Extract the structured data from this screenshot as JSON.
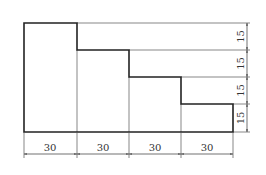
{
  "drawing": {
    "title": "Stepped block dimension drawing",
    "colors": {
      "outline": "#222222",
      "thin": "#444444",
      "text": "#333333",
      "background": "#ffffff"
    },
    "horizontal_dims": [
      {
        "label": "30"
      },
      {
        "label": "30"
      },
      {
        "label": "30"
      },
      {
        "label": "30"
      }
    ],
    "vertical_dims": [
      {
        "label": "15"
      },
      {
        "label": "15"
      },
      {
        "label": "15"
      },
      {
        "label": "15"
      }
    ]
  }
}
